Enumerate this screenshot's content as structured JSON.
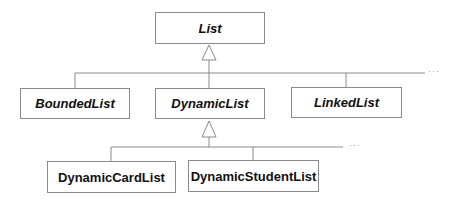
{
  "diagram": {
    "type": "uml-class-hierarchy",
    "classes": {
      "list": {
        "label": "List",
        "abstract": true
      },
      "bounded_list": {
        "label": "BoundedList",
        "abstract": true
      },
      "dynamic_list": {
        "label": "DynamicList",
        "abstract": true
      },
      "linked_list": {
        "label": "LinkedList",
        "abstract": true
      },
      "dynamic_card_list": {
        "label": "DynamicCardList",
        "abstract": false
      },
      "dynamic_student_list": {
        "label": "DynamicStudentList",
        "abstract": false
      }
    },
    "relations": [
      {
        "type": "generalization",
        "parent": "List",
        "children": [
          "BoundedList",
          "DynamicList",
          "LinkedList"
        ],
        "more": "..."
      },
      {
        "type": "generalization",
        "parent": "DynamicList",
        "children": [
          "DynamicCardList",
          "DynamicStudentList"
        ],
        "more": "..."
      }
    ],
    "ellipsis_top": "···",
    "ellipsis_bottom": "···",
    "colors": {
      "line": "#8a8a8a",
      "text": "#111111",
      "background": "#ffffff"
    }
  }
}
